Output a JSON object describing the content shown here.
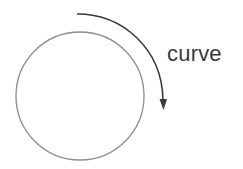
{
  "diagram": {
    "label": "curve",
    "circle": {
      "cx": 80,
      "cy": 96,
      "r": 64,
      "stroke": "#8c8c8c"
    },
    "arrow": {
      "path": "M77,14 C122,14 162,48 163,100",
      "stroke": "#3a3a3a",
      "direction": "clockwise"
    },
    "colors": {
      "background": "#ffffff",
      "text": "#3a3a3a"
    }
  }
}
